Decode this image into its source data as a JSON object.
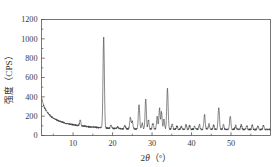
{
  "chart_data": {
    "type": "line",
    "title": "",
    "subtitle": "",
    "xlabel_prefix": "2",
    "xlabel_symbol": "θ",
    "xlabel_units": "（°）",
    "xlabel_full": "2θ（°）",
    "ylabel_cjk": "强度",
    "ylabel_units": "（CPS）",
    "ylabel_full": "强度（CPS）",
    "xlim": [
      2,
      60
    ],
    "ylim": [
      0,
      1200
    ],
    "xticks": [
      10,
      20,
      30,
      40,
      50
    ],
    "xtick_labels": [
      "10",
      "20",
      "30",
      "40",
      "50"
    ],
    "yticks": [
      0,
      200,
      400,
      600,
      800,
      1000,
      1200
    ],
    "ytick_labels": [
      "0",
      "200",
      "400",
      "600",
      "800",
      "1000",
      "1200"
    ],
    "x_minor_ticks": [
      5,
      15,
      25,
      35,
      45,
      55
    ],
    "y_minor_ticks": [
      100,
      300,
      500,
      700,
      900,
      1100
    ],
    "grid": false,
    "legend": false,
    "legend_position": "none",
    "line_color": "#404040",
    "frame_color": "#555555",
    "series_name": "XRD intensity",
    "background_baseline": [
      {
        "x": 2.0,
        "y": 390
      },
      {
        "x": 2.4,
        "y": 330
      },
      {
        "x": 2.8,
        "y": 285
      },
      {
        "x": 3.3,
        "y": 250
      },
      {
        "x": 3.8,
        "y": 222
      },
      {
        "x": 4.4,
        "y": 198
      },
      {
        "x": 5.0,
        "y": 180
      },
      {
        "x": 5.7,
        "y": 165
      },
      {
        "x": 6.5,
        "y": 150
      },
      {
        "x": 7.3,
        "y": 138
      },
      {
        "x": 8.2,
        "y": 127
      },
      {
        "x": 9.2,
        "y": 118
      },
      {
        "x": 10.3,
        "y": 110
      },
      {
        "x": 11.5,
        "y": 102
      },
      {
        "x": 12.8,
        "y": 96
      },
      {
        "x": 14.2,
        "y": 90
      },
      {
        "x": 15.8,
        "y": 85
      },
      {
        "x": 17.5,
        "y": 80
      },
      {
        "x": 19.5,
        "y": 74
      },
      {
        "x": 22.0,
        "y": 70
      },
      {
        "x": 25.0,
        "y": 68
      },
      {
        "x": 28.0,
        "y": 67
      },
      {
        "x": 32.0,
        "y": 66
      },
      {
        "x": 36.0,
        "y": 65
      },
      {
        "x": 40.0,
        "y": 64
      },
      {
        "x": 45.0,
        "y": 63
      },
      {
        "x": 50.0,
        "y": 63
      },
      {
        "x": 55.0,
        "y": 62
      },
      {
        "x": 60.0,
        "y": 62
      }
    ],
    "peaks": [
      {
        "x": 11.8,
        "height": 55,
        "width": 0.16
      },
      {
        "x": 17.75,
        "height": 945,
        "width": 0.17
      },
      {
        "x": 19.6,
        "height": 30,
        "width": 0.16
      },
      {
        "x": 21.3,
        "height": 22,
        "width": 0.15
      },
      {
        "x": 23.1,
        "height": 38,
        "width": 0.16
      },
      {
        "x": 24.5,
        "height": 115,
        "width": 0.17
      },
      {
        "x": 25.0,
        "height": 80,
        "width": 0.16
      },
      {
        "x": 26.7,
        "height": 255,
        "width": 0.17
      },
      {
        "x": 27.5,
        "height": 60,
        "width": 0.16
      },
      {
        "x": 28.4,
        "height": 310,
        "width": 0.16
      },
      {
        "x": 29.1,
        "height": 95,
        "width": 0.15
      },
      {
        "x": 30.2,
        "height": 60,
        "width": 0.16
      },
      {
        "x": 31.3,
        "height": 130,
        "width": 0.16
      },
      {
        "x": 31.9,
        "height": 215,
        "width": 0.16
      },
      {
        "x": 32.4,
        "height": 175,
        "width": 0.15
      },
      {
        "x": 33.0,
        "height": 100,
        "width": 0.15
      },
      {
        "x": 33.9,
        "height": 420,
        "width": 0.17
      },
      {
        "x": 35.1,
        "height": 55,
        "width": 0.15
      },
      {
        "x": 36.3,
        "height": 35,
        "width": 0.15
      },
      {
        "x": 37.4,
        "height": 30,
        "width": 0.15
      },
      {
        "x": 38.6,
        "height": 45,
        "width": 0.15
      },
      {
        "x": 39.5,
        "height": 38,
        "width": 0.15
      },
      {
        "x": 40.8,
        "height": 32,
        "width": 0.15
      },
      {
        "x": 42.0,
        "height": 48,
        "width": 0.15
      },
      {
        "x": 43.3,
        "height": 150,
        "width": 0.17
      },
      {
        "x": 44.4,
        "height": 55,
        "width": 0.15
      },
      {
        "x": 45.6,
        "height": 42,
        "width": 0.15
      },
      {
        "x": 46.9,
        "height": 230,
        "width": 0.17
      },
      {
        "x": 48.1,
        "height": 48,
        "width": 0.15
      },
      {
        "x": 49.8,
        "height": 135,
        "width": 0.17
      },
      {
        "x": 51.2,
        "height": 42,
        "width": 0.15
      },
      {
        "x": 52.6,
        "height": 50,
        "width": 0.15
      },
      {
        "x": 54.0,
        "height": 38,
        "width": 0.15
      },
      {
        "x": 55.4,
        "height": 45,
        "width": 0.15
      },
      {
        "x": 56.8,
        "height": 35,
        "width": 0.15
      },
      {
        "x": 58.2,
        "height": 42,
        "width": 0.15
      }
    ],
    "noise_amplitude": 9,
    "noise_seed": 20240517,
    "notable_values": {
      "max_intensity": 1010,
      "max_intensity_position": 17.75,
      "second_peak": 405,
      "second_peak_position": 33.9,
      "start_intensity": 390,
      "baseline_intensity": 65
    }
  }
}
